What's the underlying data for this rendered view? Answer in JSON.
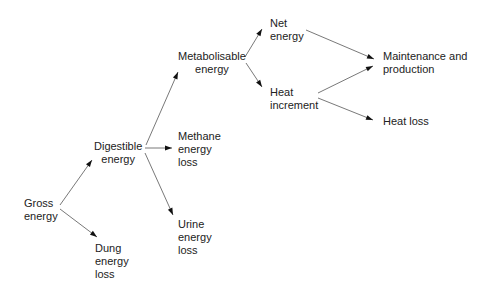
{
  "diagram": {
    "type": "energy-partition-flowchart",
    "nodes": {
      "gross": {
        "line1": "Gross",
        "line2": "energy"
      },
      "digestible": {
        "line1": "Digestible",
        "line2": "energy"
      },
      "dung": {
        "line1": "Dung",
        "line2": "energy",
        "line3": "loss"
      },
      "methane": {
        "line1": "Methane",
        "line2": "energy",
        "line3": "loss"
      },
      "urine": {
        "line1": "Urine",
        "line2": "energy",
        "line3": "loss"
      },
      "metabolisable": {
        "line1": "Metabolisable",
        "line2": "energy"
      },
      "net": {
        "line1": "Net",
        "line2": "energy"
      },
      "heat_increment": {
        "line1": "Heat",
        "line2": "increment"
      },
      "maintenance": {
        "line1": "Maintenance and",
        "line2": "production"
      },
      "heat_loss": {
        "line1": "Heat loss"
      }
    },
    "edges": [
      {
        "from": "Gross energy",
        "to": "Digestible energy"
      },
      {
        "from": "Gross energy",
        "to": "Dung energy loss"
      },
      {
        "from": "Digestible energy",
        "to": "Metabolisable energy"
      },
      {
        "from": "Digestible energy",
        "to": "Methane energy loss"
      },
      {
        "from": "Digestible energy",
        "to": "Urine energy loss"
      },
      {
        "from": "Metabolisable energy",
        "to": "Net energy"
      },
      {
        "from": "Metabolisable energy",
        "to": "Heat increment"
      },
      {
        "from": "Net energy",
        "to": "Maintenance and production"
      },
      {
        "from": "Heat increment",
        "to": "Maintenance and production"
      },
      {
        "from": "Heat increment",
        "to": "Heat loss"
      }
    ]
  }
}
